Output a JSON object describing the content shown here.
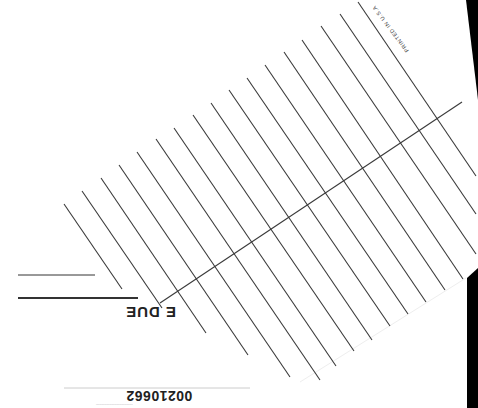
{
  "document": {
    "type": "library date due slip (scanned, rotated 180°)",
    "heading": "DATE DUE",
    "heading_visible_fragment": "E DUE",
    "printed_label": "PRINTED IN U.S.A",
    "barcode_number": "00210662",
    "barcode_fineprint": "............................................"
  },
  "colors": {
    "paper": "#ffffff",
    "ink": "#333333",
    "scanner_background": "#000000"
  },
  "geometry": {
    "rule_lines": [
      {
        "x1": 64,
        "y1": 204,
        "x2": 122,
        "y2": 289
      },
      {
        "x1": 82,
        "y1": 191,
        "x2": 162,
        "y2": 308
      },
      {
        "x1": 101,
        "y1": 178,
        "x2": 206,
        "y2": 333
      },
      {
        "x1": 119,
        "y1": 165,
        "x2": 248,
        "y2": 355
      },
      {
        "x1": 137,
        "y1": 152,
        "x2": 290,
        "y2": 377
      },
      {
        "x1": 156,
        "y1": 139,
        "x2": 320,
        "y2": 380
      },
      {
        "x1": 174,
        "y1": 128,
        "x2": 336,
        "y2": 366
      },
      {
        "x1": 193,
        "y1": 115,
        "x2": 354,
        "y2": 351
      },
      {
        "x1": 211,
        "y1": 103,
        "x2": 372,
        "y2": 340
      },
      {
        "x1": 229,
        "y1": 90,
        "x2": 390,
        "y2": 326
      },
      {
        "x1": 247,
        "y1": 78,
        "x2": 408,
        "y2": 314
      },
      {
        "x1": 265,
        "y1": 65,
        "x2": 426,
        "y2": 302
      },
      {
        "x1": 284,
        "y1": 52,
        "x2": 445,
        "y2": 290
      },
      {
        "x1": 302,
        "y1": 40,
        "x2": 463,
        "y2": 279
      },
      {
        "x1": 321,
        "y1": 26,
        "x2": 476,
        "y2": 254
      },
      {
        "x1": 340,
        "y1": 14,
        "x2": 476,
        "y2": 214
      },
      {
        "x1": 358,
        "y1": 2,
        "x2": 476,
        "y2": 176
      }
    ],
    "cross_line": {
      "x1": 160,
      "y1": 303,
      "x2": 462,
      "y2": 102
    },
    "heading_rules": [
      {
        "x1": 18,
        "y1": 275,
        "x2": 95,
        "y2": 275,
        "width": 1
      },
      {
        "x1": 18,
        "y1": 298,
        "x2": 138,
        "y2": 298,
        "width": 2
      }
    ],
    "barcode_rule": {
      "x1": 64,
      "y1": 388,
      "x2": 250,
      "y2": 388
    }
  }
}
